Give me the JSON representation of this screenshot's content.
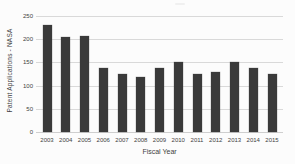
{
  "chart_data": {
    "type": "bar",
    "title": "",
    "categories": [
      "2003",
      "2004",
      "2005",
      "2006",
      "2007",
      "2008",
      "2009",
      "2010",
      "2011",
      "2012",
      "2013",
      "2014",
      "2015"
    ],
    "values": [
      230,
      204,
      208,
      139,
      124,
      118,
      137,
      151,
      125,
      130,
      151,
      137,
      126
    ],
    "xlabel": "Fiscal Year",
    "ylabel": "Patent Applications - NASA",
    "ylim": [
      0,
      250
    ],
    "yticks": [
      0,
      50,
      100,
      150,
      200,
      250
    ],
    "grid": "horizontal",
    "legend": "none",
    "bar_color": "#3a3a3a",
    "gridline_color": "#d9d9d9",
    "background_color": "#fcfcfc",
    "text_color": "#3f3f3f"
  }
}
